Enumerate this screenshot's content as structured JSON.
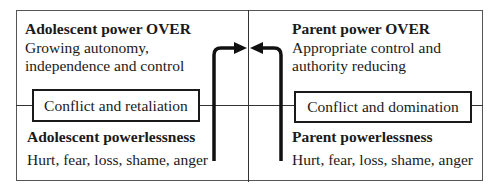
{
  "diagram": {
    "left_quadrant": {
      "top": {
        "heading": "Adolescent power OVER",
        "lines": [
          "Growing autonomy,",
          "independence and control"
        ]
      },
      "box_label": "Conflict and retaliation",
      "bottom": {
        "heading": "Adolescent powerlessness",
        "lines": [
          "Hurt, fear, loss, shame, anger"
        ]
      }
    },
    "right_quadrant": {
      "top": {
        "heading": "Parent power OVER",
        "lines": [
          "Appropriate control and",
          "authority reducing"
        ]
      },
      "box_label": "Conflict and domination",
      "bottom": {
        "heading": "Parent powerlessness",
        "lines": [
          "Hurt, fear, loss, shame, anger"
        ]
      }
    },
    "arrows": [
      {
        "name": "adolescent-to-center",
        "direction": "up-then-right"
      },
      {
        "name": "parent-to-center",
        "direction": "up-then-left"
      }
    ],
    "colors": {
      "line": "#333333",
      "text": "#1a1a1a",
      "background": "#ffffff"
    }
  }
}
